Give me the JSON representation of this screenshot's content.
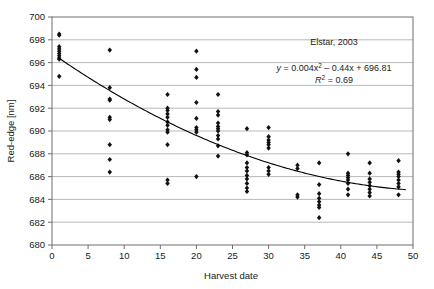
{
  "chart_data": {
    "type": "scatter",
    "title": "",
    "xlabel": "Harvest date",
    "ylabel": "Red-edge [nm]",
    "xlim": [
      0,
      50
    ],
    "ylim": [
      680,
      700
    ],
    "xticks": [
      0,
      5,
      10,
      15,
      20,
      25,
      30,
      35,
      40,
      45,
      50
    ],
    "yticks": [
      680,
      682,
      684,
      686,
      688,
      690,
      692,
      694,
      696,
      698,
      700
    ],
    "grid": "horizontal",
    "legend": "none",
    "marker": "diamond",
    "marker_color": "#111111",
    "gridline_color": "#b9b9b9",
    "frame_color": "#6e6e6e",
    "annotations": {
      "sample_label": "Elstar, 2003",
      "equation_prefix": "y",
      "equation_body": " = 0.004x",
      "equation_exp1": "2",
      "equation_mid": " – 0.44x + 696.81",
      "r2_symbol": "R",
      "r2_exp": "2",
      "r2_value": " = 0.69",
      "equation_full": "y = 0.004x2 – 0.44x + 696.81",
      "r2_full": "R2 = 0.69"
    },
    "fit": {
      "type": "quadratic",
      "a": 0.004,
      "b": -0.44,
      "c": 696.81,
      "r_squared": 0.69,
      "x_start": 1,
      "x_end": 49
    },
    "points": [
      [
        1,
        698.5
      ],
      [
        1,
        698.4
      ],
      [
        1,
        697.4
      ],
      [
        1,
        697.2
      ],
      [
        1,
        697.0
      ],
      [
        1,
        696.8
      ],
      [
        1,
        696.6
      ],
      [
        1,
        696.4
      ],
      [
        1,
        696.3
      ],
      [
        1,
        694.8
      ],
      [
        8,
        697.1
      ],
      [
        8,
        693.8
      ],
      [
        8,
        692.8
      ],
      [
        8,
        692.7
      ],
      [
        8,
        691.2
      ],
      [
        8,
        691.0
      ],
      [
        8,
        688.8
      ],
      [
        8,
        687.5
      ],
      [
        8,
        686.4
      ],
      [
        16,
        693.2
      ],
      [
        16,
        692.0
      ],
      [
        16,
        691.8
      ],
      [
        16,
        691.5
      ],
      [
        16,
        691.2
      ],
      [
        16,
        690.8
      ],
      [
        16,
        690.5
      ],
      [
        16,
        690.1
      ],
      [
        16,
        689.9
      ],
      [
        16,
        688.8
      ],
      [
        16,
        685.7
      ],
      [
        16,
        685.4
      ],
      [
        20,
        697.0
      ],
      [
        20,
        695.4
      ],
      [
        20,
        694.7
      ],
      [
        20,
        692.5
      ],
      [
        20,
        691.1
      ],
      [
        20,
        690.3
      ],
      [
        20,
        690.1
      ],
      [
        20,
        689.9
      ],
      [
        20,
        686.0
      ],
      [
        23,
        693.2
      ],
      [
        23,
        691.7
      ],
      [
        23,
        691.4
      ],
      [
        23,
        690.7
      ],
      [
        23,
        690.4
      ],
      [
        23,
        690.2
      ],
      [
        23,
        690.0
      ],
      [
        23,
        689.6
      ],
      [
        23,
        689.3
      ],
      [
        23,
        688.7
      ],
      [
        23,
        687.8
      ],
      [
        27,
        690.2
      ],
      [
        27,
        688.1
      ],
      [
        27,
        687.9
      ],
      [
        27,
        687.2
      ],
      [
        27,
        686.8
      ],
      [
        27,
        686.5
      ],
      [
        27,
        686.1
      ],
      [
        27,
        685.8
      ],
      [
        27,
        685.4
      ],
      [
        27,
        685.0
      ],
      [
        27,
        684.7
      ],
      [
        30,
        690.3
      ],
      [
        30,
        689.5
      ],
      [
        30,
        689.2
      ],
      [
        30,
        689.0
      ],
      [
        30,
        688.8
      ],
      [
        30,
        688.5
      ],
      [
        30,
        686.8
      ],
      [
        30,
        686.5
      ],
      [
        30,
        686.2
      ],
      [
        34,
        687.0
      ],
      [
        34,
        686.7
      ],
      [
        34,
        684.4
      ],
      [
        34,
        684.2
      ],
      [
        37,
        687.2
      ],
      [
        37,
        685.3
      ],
      [
        37,
        684.5
      ],
      [
        37,
        684.1
      ],
      [
        37,
        683.8
      ],
      [
        37,
        683.5
      ],
      [
        37,
        683.3
      ],
      [
        37,
        682.4
      ],
      [
        41,
        688.0
      ],
      [
        41,
        686.3
      ],
      [
        41,
        686.1
      ],
      [
        41,
        685.9
      ],
      [
        41,
        685.7
      ],
      [
        41,
        685.4
      ],
      [
        41,
        684.9
      ],
      [
        41,
        684.4
      ],
      [
        44,
        687.2
      ],
      [
        44,
        686.3
      ],
      [
        44,
        685.8
      ],
      [
        44,
        685.5
      ],
      [
        44,
        685.2
      ],
      [
        44,
        684.9
      ],
      [
        44,
        684.6
      ],
      [
        44,
        684.3
      ],
      [
        48,
        687.4
      ],
      [
        48,
        686.4
      ],
      [
        48,
        686.2
      ],
      [
        48,
        686.0
      ],
      [
        48,
        685.7
      ],
      [
        48,
        685.4
      ],
      [
        48,
        685.1
      ],
      [
        48,
        684.4
      ]
    ]
  }
}
